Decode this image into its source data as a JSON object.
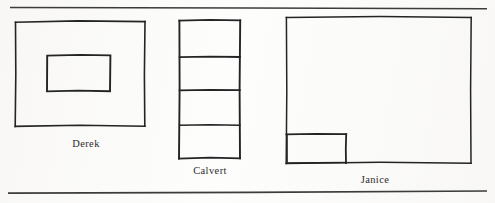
{
  "page": {
    "width": 495,
    "height": 203,
    "background_color": "#fdfdfc",
    "ink_color": "#242424",
    "rule_color": "#3a3a3a"
  },
  "rules": {
    "top": {
      "name": "top-rule",
      "x1": 10,
      "y1": 7,
      "x2": 487,
      "y2": 9
    },
    "bottom": {
      "name": "bottom-rule",
      "x1": 8,
      "y1": 193,
      "x2": 487,
      "y2": 191
    }
  },
  "figures": [
    {
      "id": "derek",
      "label": "Derek",
      "label_x": 86,
      "label_y": 139,
      "outer": {
        "x": 15,
        "y": 21,
        "width": 130,
        "height": 105
      },
      "parts": [
        {
          "name": "inner-rectangle",
          "x": 47,
          "y": 55,
          "width": 63,
          "height": 36
        }
      ],
      "shape_description": "Large rectangle containing one smaller centered rectangle"
    },
    {
      "id": "calvert",
      "label": "Calvert",
      "label_x": 209,
      "label_y": 166,
      "outer": {
        "x": 179,
        "y": 20,
        "width": 61,
        "height": 138
      },
      "dividers_y": [
        57,
        90,
        125
      ],
      "shape_description": "Tall narrow rectangle divided by three horizontal lines into four stacked bands"
    },
    {
      "id": "janice",
      "label": "Janice",
      "label_x": 375,
      "label_y": 175,
      "outer": {
        "x": 286,
        "y": 17,
        "width": 185,
        "height": 146
      },
      "parts": [
        {
          "name": "corner-rectangle",
          "x": 286,
          "y": 134,
          "width": 60,
          "height": 29
        }
      ],
      "shape_description": "Large rectangle with a small rectangle drawn in the lower-left corner, sharing the left and bottom edges"
    }
  ]
}
